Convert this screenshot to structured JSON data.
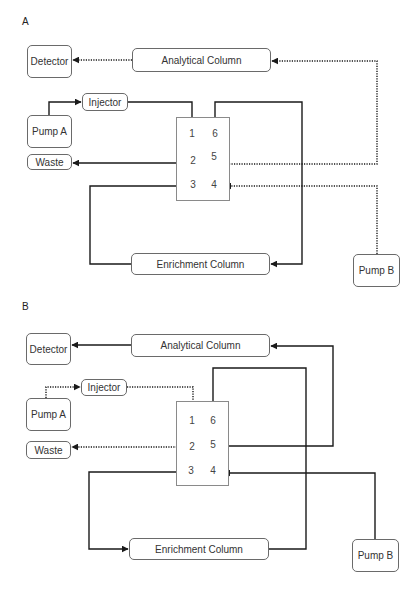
{
  "panels": [
    {
      "id": "A",
      "label": "A",
      "label_pos": [
        22,
        16
      ],
      "boxes": [
        {
          "key": "detector",
          "label": "Detector",
          "x": 27,
          "y": 45,
          "w": 45,
          "h": 33
        },
        {
          "key": "analytical-column",
          "label": "Analytical Column",
          "x": 132,
          "y": 48,
          "w": 139,
          "h": 24
        },
        {
          "key": "injector",
          "label": "Injector",
          "x": 82,
          "y": 93,
          "w": 46,
          "h": 18
        },
        {
          "key": "pump-a",
          "label": "Pump A",
          "x": 27,
          "y": 115,
          "w": 45,
          "h": 33
        },
        {
          "key": "waste",
          "label": "Waste",
          "x": 27,
          "y": 154,
          "w": 45,
          "h": 16
        },
        {
          "key": "enrichment-column",
          "label": "Enrichment Column",
          "x": 131,
          "y": 253,
          "w": 139,
          "h": 22
        },
        {
          "key": "pump-b",
          "label": "Pump B",
          "x": 353,
          "y": 254,
          "w": 47,
          "h": 33
        }
      ],
      "valve": {
        "outer": {
          "x": 176,
          "y": 117,
          "w": 54,
          "h": 84
        },
        "inner": {
          "x": 183,
          "y": 122,
          "w": 41,
          "h": 72
        },
        "row_dividers": [
          145,
          175
        ],
        "col_divider": 204,
        "ports": [
          {
            "n": "1",
            "x": 192,
            "y": 133
          },
          {
            "n": "6",
            "x": 215,
            "y": 133
          },
          {
            "n": "2",
            "x": 193,
            "y": 160
          },
          {
            "n": "5",
            "x": 214,
            "y": 156
          },
          {
            "n": "3",
            "x": 193,
            "y": 184
          },
          {
            "n": "4",
            "x": 214,
            "y": 184
          }
        ]
      },
      "connections": [
        {
          "from": "analytical-column",
          "to": "detector",
          "style": "dotted",
          "points": [
            [
              132,
              60
            ],
            [
              73,
              60
            ]
          ]
        },
        {
          "from": "pump-a",
          "to": "injector",
          "style": "solid",
          "points": [
            [
              49,
              115
            ],
            [
              49,
              102
            ],
            [
              81,
              102
            ]
          ]
        },
        {
          "from": "injector",
          "to": "valve-port-1",
          "style": "solid",
          "points": [
            [
              128,
              102
            ],
            [
              192,
              102
            ],
            [
              192,
              124
            ]
          ]
        },
        {
          "from": "valve-port-6",
          "to": "enrichment-column",
          "style": "solid",
          "points": [
            [
              215,
              122
            ],
            [
              215,
              102
            ],
            [
              302,
              102
            ],
            [
              302,
              264
            ],
            [
              271,
              264
            ]
          ]
        },
        {
          "from": "valve-port-2",
          "to": "waste",
          "style": "solid",
          "points": [
            [
              183,
              163
            ],
            [
              73,
              163
            ]
          ]
        },
        {
          "from": "enrichment-column",
          "to": "valve-port-3",
          "style": "solid",
          "points": [
            [
              131,
              264
            ],
            [
              90,
              264
            ],
            [
              90,
              186
            ],
            [
              182,
              186
            ]
          ]
        },
        {
          "from": "valve-port-5",
          "to": "analytical-column",
          "style": "dotted",
          "points": [
            [
              224,
              164
            ],
            [
              377,
              164
            ],
            [
              377,
              61
            ],
            [
              272,
              61
            ]
          ]
        },
        {
          "from": "pump-b",
          "to": "valve-port-4",
          "style": "dotted",
          "points": [
            [
              377,
              254
            ],
            [
              377,
              186
            ],
            [
              225,
              186
            ]
          ]
        }
      ],
      "internal_arrows": [
        {
          "label": "1 to 6",
          "style": "solid",
          "points": [
            [
              196,
              133
            ],
            [
              209,
              133
            ]
          ]
        },
        {
          "label": "3 to 2",
          "style": "solid",
          "points": [
            [
              193,
              177
            ],
            [
              193,
              166
            ]
          ]
        },
        {
          "label": "4 to 5",
          "style": "dotted",
          "points": [
            [
              214,
              178
            ],
            [
              214,
              166
            ]
          ]
        }
      ]
    },
    {
      "id": "B",
      "label": "B",
      "label_pos": [
        22,
        301
      ],
      "boxes": [
        {
          "key": "detector",
          "label": "Detector",
          "x": 26,
          "y": 333,
          "w": 45,
          "h": 32
        },
        {
          "key": "analytical-column",
          "label": "Analytical Column",
          "x": 131,
          "y": 334,
          "w": 139,
          "h": 23
        },
        {
          "key": "injector",
          "label": "Injector",
          "x": 81,
          "y": 379,
          "w": 46,
          "h": 17
        },
        {
          "key": "pump-a",
          "label": "Pump A",
          "x": 26,
          "y": 398,
          "w": 45,
          "h": 33
        },
        {
          "key": "waste",
          "label": "Waste",
          "x": 26,
          "y": 441,
          "w": 45,
          "h": 18
        },
        {
          "key": "enrichment-column",
          "label": "Enrichment Column",
          "x": 129,
          "y": 538,
          "w": 140,
          "h": 22
        },
        {
          "key": "pump-b",
          "label": "Pump B",
          "x": 352,
          "y": 539,
          "w": 47,
          "h": 33
        }
      ],
      "valve": {
        "outer": {
          "x": 176,
          "y": 401,
          "w": 53,
          "h": 85
        },
        "inner": {
          "x": 182,
          "y": 409,
          "w": 41,
          "h": 70
        },
        "row_dividers": [
          430,
          460
        ],
        "col_divider": 202,
        "ports": [
          {
            "n": "1",
            "x": 192,
            "y": 420
          },
          {
            "n": "6",
            "x": 213,
            "y": 420
          },
          {
            "n": "2",
            "x": 192,
            "y": 446
          },
          {
            "n": "5",
            "x": 213,
            "y": 444
          },
          {
            "n": "3",
            "x": 191,
            "y": 470
          },
          {
            "n": "4",
            "x": 213,
            "y": 470
          }
        ]
      },
      "connections": [
        {
          "from": "analytical-column",
          "to": "detector",
          "style": "solid",
          "points": [
            [
              131,
              345
            ],
            [
              72,
              345
            ]
          ]
        },
        {
          "from": "pump-a",
          "to": "injector",
          "style": "dotted",
          "points": [
            [
              46,
              398
            ],
            [
              46,
              387
            ],
            [
              80,
              387
            ]
          ]
        },
        {
          "from": "injector",
          "to": "valve-port-1",
          "style": "dotted",
          "points": [
            [
              127,
              387
            ],
            [
              193,
              387
            ],
            [
              193,
              410
            ]
          ]
        },
        {
          "from": "valve-port-2",
          "to": "waste",
          "style": "dotted",
          "points": [
            [
              182,
              447
            ],
            [
              72,
              447
            ]
          ]
        },
        {
          "from": "enrichment-column",
          "to": "valve-port-6",
          "style": "solid",
          "points": [
            [
              269,
              549
            ],
            [
              306,
              549
            ],
            [
              306,
              368
            ],
            [
              213,
              368
            ],
            [
              213,
              409
            ]
          ]
        },
        {
          "from": "valve-port-5",
          "to": "analytical-column",
          "style": "solid",
          "points": [
            [
              223,
              446
            ],
            [
              333,
              446
            ],
            [
              333,
              346
            ],
            [
              271,
              346
            ]
          ]
        },
        {
          "from": "pump-b",
          "to": "valve-port-4",
          "style": "solid",
          "points": [
            [
              375,
              539
            ],
            [
              375,
              473
            ],
            [
              224,
              473
            ]
          ]
        },
        {
          "from": "valve-port-3",
          "to": "enrichment-column",
          "style": "solid",
          "points": [
            [
              182,
              472
            ],
            [
              89,
              472
            ],
            [
              89,
              549
            ],
            [
              128,
              549
            ]
          ]
        }
      ],
      "internal_arrows": [
        {
          "label": "1 to 2",
          "style": "solid",
          "points": [
            [
              192,
              425
            ],
            [
              192,
              437
            ]
          ]
        },
        {
          "label": "6 to 5",
          "style": "solid",
          "points": [
            [
              213,
              425
            ],
            [
              213,
              437
            ]
          ]
        },
        {
          "label": "4 to 3",
          "style": "solid",
          "points": [
            [
              208,
              472
            ],
            [
              196,
              472
            ]
          ]
        }
      ]
    }
  ],
  "colors": {
    "line": "#1a1a1a",
    "box_border": "#6a6a6a",
    "valve_outer": "#8a8a8a",
    "text": "#333333"
  }
}
